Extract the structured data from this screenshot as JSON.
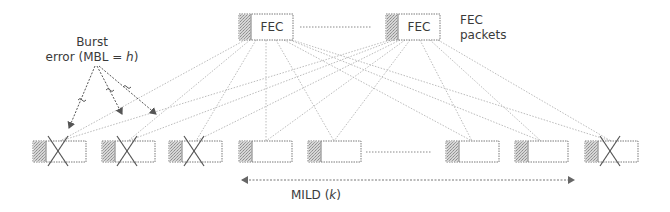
{
  "diagram": {
    "title_labels": {
      "fec_packet_text": "FEC",
      "fec_packets_line1": "FEC",
      "fec_packets_line2": "packets",
      "burst_line1": "Burst",
      "burst_line2_prefix": "error (MBL = ",
      "burst_var": "h",
      "burst_line2_suffix": ")",
      "mild_prefix": "MILD (",
      "mild_var": "k",
      "mild_suffix": ")"
    },
    "colors": {
      "border": "#7a7a7a",
      "header_fill": "#bdbdbd",
      "line": "#b8b8b8",
      "text": "#3a3a3a",
      "arrow": "#555555"
    },
    "fec_packets": [
      {
        "x": 239,
        "y": 14,
        "label": "FEC"
      },
      {
        "x": 386,
        "y": 14,
        "label": "FEC"
      }
    ],
    "data_packets": [
      {
        "x": 33,
        "lost": true
      },
      {
        "x": 102,
        "lost": true
      },
      {
        "x": 169,
        "lost": true
      },
      {
        "x": 239,
        "lost": false
      },
      {
        "x": 308,
        "lost": false
      },
      {
        "x": 446,
        "lost": false
      },
      {
        "x": 515,
        "lost": false
      },
      {
        "x": 585,
        "lost": true
      }
    ],
    "packet_row_y": 141
  }
}
